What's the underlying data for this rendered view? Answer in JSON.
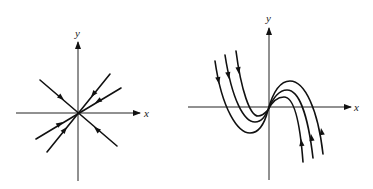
{
  "figure": {
    "panels": [
      {
        "id": "left",
        "description": "Phase portrait: all trajectories are straight lines through the origin, directed toward origin (stable star/node)",
        "axes": {
          "x_label": "x",
          "y_label": "y"
        },
        "trajectory_count": 3,
        "flow_direction": "toward-origin"
      },
      {
        "id": "right",
        "description": "Phase portrait: cubic-shaped trajectories passing through origin, flowing down on the left and up on the right",
        "axes": {
          "x_label": "x",
          "y_label": "y"
        },
        "trajectory_count": 3,
        "flow_direction": "left-branch-down, right-branch-up"
      }
    ]
  },
  "colors": {
    "line": "#111111",
    "axis": "#222222",
    "background": "#ffffff"
  }
}
